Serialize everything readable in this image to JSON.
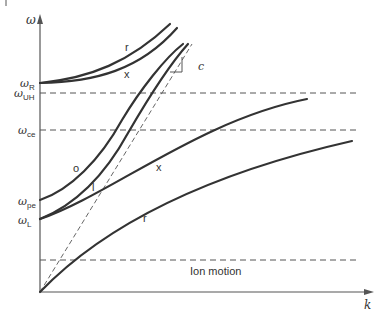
{
  "diagram": {
    "axes": {
      "y_label": "ω",
      "x_label": "k"
    },
    "levels": [
      {
        "id": "omega_R",
        "symbol": "ω",
        "subscript": "R",
        "style": "tick"
      },
      {
        "id": "omega_UH",
        "symbol": "ω",
        "subscript": "UH",
        "style": "dashed"
      },
      {
        "id": "omega_ce",
        "symbol": "ω",
        "subscript": "ce",
        "style": "dashed"
      },
      {
        "id": "omega_pe",
        "symbol": "ω",
        "subscript": "pe",
        "style": "tick"
      },
      {
        "id": "omega_L",
        "symbol": "ω",
        "subscript": "L",
        "style": "tick"
      }
    ],
    "curve_labels": {
      "r_upper": "r",
      "x_upper": "x",
      "o": "o",
      "l": "l",
      "x_lower": "x",
      "r_lower": "r"
    },
    "light_line_label": "c",
    "ion_motion_label": "Ion motion",
    "colors": {
      "curve": "#333333",
      "dashed": "#555555",
      "background": "#ffffff"
    }
  }
}
